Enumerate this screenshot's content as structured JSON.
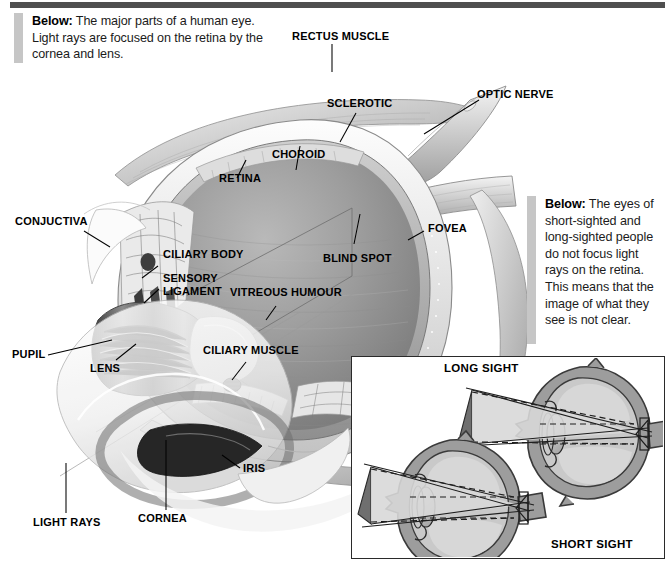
{
  "page": {
    "width": 671,
    "height": 567,
    "background": "#ffffff",
    "rule_color": "#4f4f4f",
    "accent_color": "#c6c6c6"
  },
  "captions": {
    "left": {
      "lead": "Below:",
      "body": " The major parts of a human eye. Light rays are focused on the retina by the cornea and lens."
    },
    "right": {
      "lead": "Below:",
      "body": " The eyes of short-sighted and long-sighted people do not focus light rays on the retina. This means that the image of what they see is not clear."
    }
  },
  "labels": [
    {
      "id": "rectus-muscle",
      "text": "RECTUS MUSCLE"
    },
    {
      "id": "optic-nerve",
      "text": "OPTIC NERVE"
    },
    {
      "id": "sclerotic",
      "text": "SCLEROTIC"
    },
    {
      "id": "choroid",
      "text": "CHOROID"
    },
    {
      "id": "retina",
      "text": "RETINA"
    },
    {
      "id": "conjuctiva",
      "text": "CONJUCTIVA"
    },
    {
      "id": "ciliary-body",
      "text": "CILIARY BODY"
    },
    {
      "id": "sensory-ligament",
      "text": "SENSORY LIGAMENT"
    },
    {
      "id": "vitreous-humour",
      "text": "VITREOUS HUMOUR"
    },
    {
      "id": "blind-spot",
      "text": "BLIND SPOT"
    },
    {
      "id": "fovea",
      "text": "FOVEA"
    },
    {
      "id": "pupil",
      "text": "PUPIL"
    },
    {
      "id": "lens",
      "text": "LENS"
    },
    {
      "id": "ciliary-muscle",
      "text": "CILIARY MUSCLE"
    },
    {
      "id": "iris",
      "text": "IRIS"
    },
    {
      "id": "cornea",
      "text": "CORNEA"
    },
    {
      "id": "light-rays",
      "text": "LIGHT RAYS"
    }
  ],
  "inset": {
    "long_sight_label": "LONG SIGHT",
    "short_sight_label": "SHORT SIGHT"
  },
  "palette": {
    "ink": "#000000",
    "sclera_outline": "#2a2a2a",
    "sclera_fill": "#9a9a9a",
    "interior_fill": "#c9c9c9",
    "lens_fill": "#b4b4b4",
    "ray_fill": "#d5d5d5",
    "vitreous_dark": "#7c7c7c",
    "vitreous_mid": "#a7a7a7",
    "vitreous_light": "#d0d0d0",
    "cornea_light": "#f2f2f2"
  }
}
